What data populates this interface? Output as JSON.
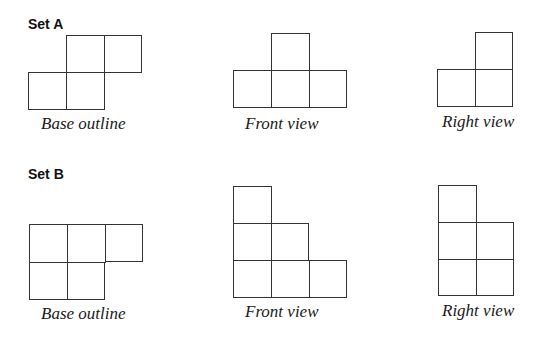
{
  "sets": [
    {
      "title": "Set A",
      "views": [
        {
          "label": "Base outline",
          "cells": [
            [
              66,
              35
            ],
            [
              104,
              35
            ],
            [
              28,
              72
            ],
            [
              66,
              72
            ]
          ]
        },
        {
          "label": "Front view",
          "cells": [
            [
              271,
              33
            ],
            [
              233,
              70
            ],
            [
              271,
              70
            ],
            [
              309,
              70
            ]
          ]
        },
        {
          "label": "Right view",
          "cells": [
            [
              475,
              32
            ],
            [
              437,
              69
            ],
            [
              475,
              69
            ]
          ]
        }
      ]
    },
    {
      "title": "Set B",
      "views": [
        {
          "label": "Base outline",
          "cells": [
            [
              29,
              224
            ],
            [
              67,
              224
            ],
            [
              105,
              224
            ],
            [
              29,
              262
            ],
            [
              67,
              262
            ]
          ]
        },
        {
          "label": "Front view",
          "cells": [
            [
              233,
              186
            ],
            [
              233,
              223
            ],
            [
              271,
              223
            ],
            [
              233,
              260
            ],
            [
              271,
              260
            ],
            [
              309,
              260
            ]
          ]
        },
        {
          "label": "Right view",
          "cells": [
            [
              438,
              185
            ],
            [
              438,
              222
            ],
            [
              476,
              222
            ],
            [
              438,
              259
            ],
            [
              476,
              259
            ]
          ]
        }
      ]
    }
  ],
  "layout": {
    "cell_size": 38,
    "line_color": "#333333",
    "titles_pos": [
      [
        28,
        17
      ],
      [
        28,
        167
      ]
    ],
    "label_pos": [
      [
        [
          41,
          115
        ],
        [
          245,
          115
        ],
        [
          442,
          113
        ]
      ],
      [
        [
          41,
          305
        ],
        [
          245,
          303
        ],
        [
          442,
          302
        ]
      ]
    ]
  }
}
